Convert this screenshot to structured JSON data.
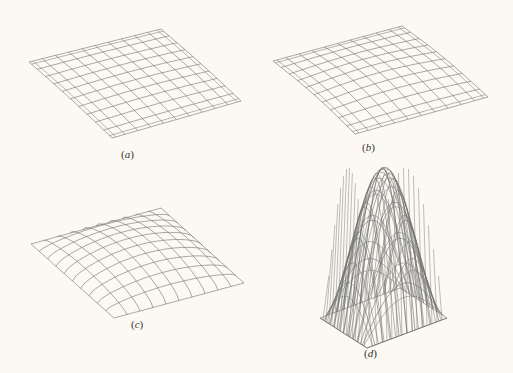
{
  "figure": {
    "background": "#fbf9f1",
    "line_color": "#6f6f6f",
    "panels": [
      {
        "id": "a",
        "label": "(a)",
        "label_pos": [
          121,
          157
        ],
        "description": "Nearly flat surface mesh, 10x10 grid",
        "grid": 10,
        "corners": {
          "p00": [
            29,
            62
          ],
          "p10": [
            161,
            29
          ],
          "p01": [
            112,
            138
          ],
          "p11": [
            241,
            101
          ]
        },
        "height": 3,
        "mode": "sag"
      },
      {
        "id": "b",
        "label": "(b)",
        "label_pos": [
          362,
          150
        ],
        "description": "Slightly curved surface mesh, 10x10 grid",
        "grid": 10,
        "corners": {
          "p00": [
            273,
            61
          ],
          "p10": [
            402,
            26
          ],
          "p01": [
            355,
            134
          ],
          "p11": [
            488,
            97
          ]
        },
        "height": 7,
        "mode": "sag"
      },
      {
        "id": "c",
        "label": "(c)",
        "label_pos": [
          131,
          327
        ],
        "description": "Bulged dome surface mesh, 10x10 grid",
        "grid": 10,
        "corners": {
          "p00": [
            31,
            244
          ],
          "p10": [
            161,
            208
          ],
          "p01": [
            114,
            318
          ],
          "p11": [
            244,
            283
          ]
        },
        "height": 18,
        "mode": "dome"
      },
      {
        "id": "d",
        "label": "(d)",
        "label_pos": [
          364,
          356
        ],
        "description": "Tall sinusoidal dome surface mesh",
        "grid": 10,
        "corners": {
          "p00": [
            320,
            318
          ],
          "p10": [
            400,
            288
          ],
          "p01": [
            367,
            348
          ],
          "p11": [
            447,
            318
          ]
        },
        "height": 150,
        "mode": "peak"
      }
    ]
  }
}
